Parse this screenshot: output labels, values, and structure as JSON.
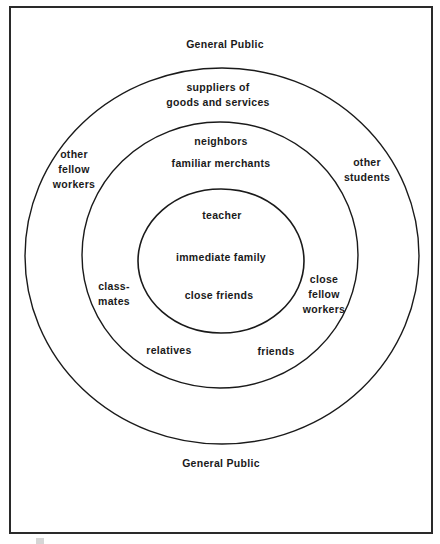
{
  "diagram": {
    "type": "concentric-circles",
    "rings": [
      {
        "name": "outer-region",
        "labels": [
          {
            "id": "general_public_top",
            "lines": [
              "General Public"
            ]
          },
          {
            "id": "general_public_bottom",
            "lines": [
              "General Public"
            ]
          }
        ]
      },
      {
        "name": "outer-circle",
        "labels": [
          {
            "id": "suppliers",
            "lines": [
              "suppliers of",
              "goods and services"
            ]
          },
          {
            "id": "other_fellow_workers",
            "lines": [
              "other",
              "fellow",
              "workers"
            ]
          },
          {
            "id": "other_students",
            "lines": [
              "other",
              "students"
            ]
          }
        ]
      },
      {
        "name": "middle-circle",
        "labels": [
          {
            "id": "neighbors",
            "lines": [
              "neighbors"
            ]
          },
          {
            "id": "familiar_merchants",
            "lines": [
              "familiar merchants"
            ]
          },
          {
            "id": "classmates",
            "lines": [
              "class-",
              "mates"
            ]
          },
          {
            "id": "close_fellow_workers",
            "lines": [
              "close",
              "fellow",
              "workers"
            ]
          },
          {
            "id": "relatives",
            "lines": [
              "relatives"
            ]
          },
          {
            "id": "friends",
            "lines": [
              "friends"
            ]
          }
        ]
      },
      {
        "name": "inner-circle",
        "labels": [
          {
            "id": "teacher",
            "lines": [
              "teacher"
            ]
          },
          {
            "id": "immediate_family",
            "lines": [
              "immediate family"
            ]
          },
          {
            "id": "close_friends",
            "lines": [
              "close friends"
            ]
          }
        ]
      }
    ]
  },
  "colors": {
    "stroke": "#1a1a1a",
    "background": "#ffffff",
    "text": "#1a1a1a"
  }
}
